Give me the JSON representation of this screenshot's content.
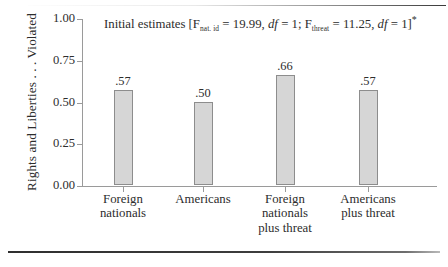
{
  "chart_data": {
    "type": "bar",
    "title_parts": {
      "lead": "Initial estimates [F",
      "sub1": "nat. id",
      "mid1": " = 19.99, ",
      "df1": "df",
      "mid2": " = 1; F",
      "sub2": "threat",
      "mid3": " = 11.25, ",
      "df2": "df",
      "tail": " = 1]",
      "star": "*"
    },
    "categories": [
      "Foreign\nnationals",
      "Americans",
      "Foreign\nnationals\nplus threat",
      "Americans\nplus threat"
    ],
    "category_lines": [
      [
        "Foreign",
        "nationals"
      ],
      [
        "Americans"
      ],
      [
        "Foreign",
        "nationals",
        "plus threat"
      ],
      [
        "Americans",
        "plus threat"
      ]
    ],
    "values": [
      0.57,
      0.5,
      0.66,
      0.57
    ],
    "value_labels": [
      ".57",
      ".50",
      ".66",
      ".57"
    ],
    "xlabel": "",
    "ylabel": "Rights and Liberties . . . Violated",
    "ylim": [
      0.0,
      1.0
    ],
    "ytick_labels": [
      "0.00",
      "0.25",
      "0.50",
      "0.75",
      "1.00"
    ],
    "ytick_values": [
      0.0,
      0.25,
      0.5,
      0.75,
      1.0
    ],
    "grid": false,
    "legend": null,
    "bar_color": "#d6d6d6",
    "bar_border_color": "#8d8d8d",
    "axis_color": "#9a9a9a",
    "text_color": "#2d2d2d"
  }
}
